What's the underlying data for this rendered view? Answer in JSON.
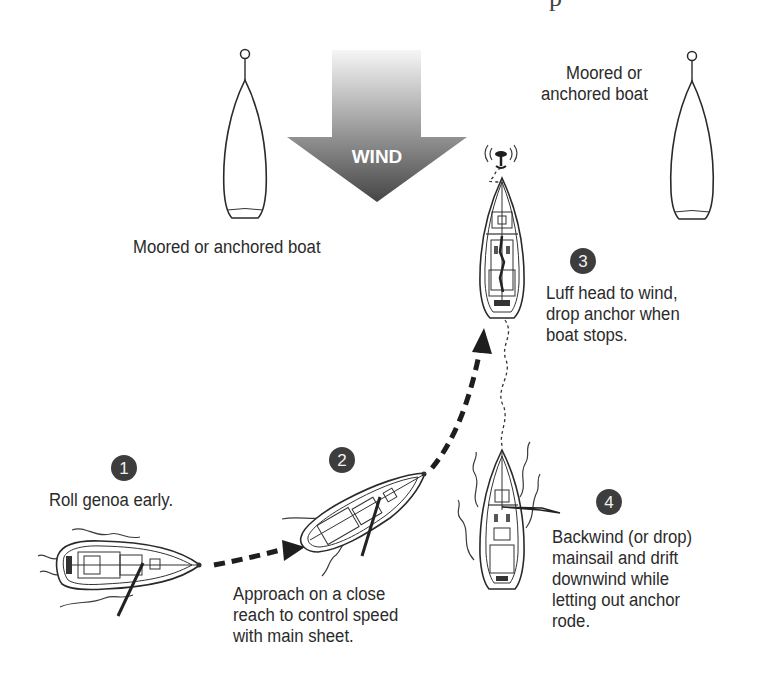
{
  "figure": {
    "top_fragment": "p",
    "wind_label": "WIND",
    "colors": {
      "wind_arrow_top": "#f4f4f4",
      "wind_arrow_bottom": "#4a4a4a",
      "badge_fill": "#3d3d3d",
      "text": "#2b2b2b"
    },
    "moored_boats": [
      {
        "label": "Moored or anchored boat"
      },
      {
        "label_line1": "Moored or",
        "label_line2": "anchored boat"
      }
    ],
    "steps": [
      {
        "number": "1",
        "lines": [
          "Roll genoa early."
        ]
      },
      {
        "number": "2",
        "lines": [
          "Approach on a close",
          "reach to control speed",
          "with main sheet."
        ]
      },
      {
        "number": "3",
        "lines": [
          "Luff head to wind,",
          "drop anchor when",
          "boat stops."
        ]
      },
      {
        "number": "4",
        "lines": [
          "Backwind (or drop)",
          "mainsail and drift",
          "downwind while",
          "letting out anchor",
          "rode."
        ]
      }
    ]
  }
}
